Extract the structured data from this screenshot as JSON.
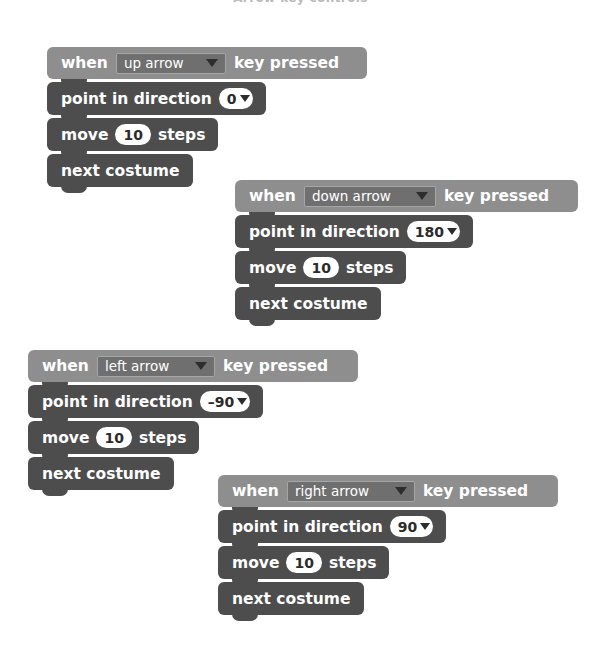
{
  "page": {
    "title": "Arrow key controls",
    "background": "#ffffff"
  },
  "palette": {
    "event_block": "#8e8e8e",
    "stack_block": "#4d4d4d",
    "dropdown_field": "#6f6f6f",
    "dropdown_border": "#a6a6a6",
    "input_oval": "#ffffff",
    "text": "#ffffff",
    "oval_text": "#2b2b2b"
  },
  "scripts": [
    {
      "id": "script-up-arrow",
      "position": {
        "left": 47,
        "top": 27
      },
      "hat": {
        "name": "when-key-pressed-block",
        "prefix": "when",
        "suffix": "key pressed",
        "dropdown": {
          "name": "key-dropdown",
          "value": "up arrow",
          "icon": "chevron-down-icon",
          "width": 110
        },
        "dome_width": 156,
        "body_width": 320
      },
      "blocks": [
        {
          "name": "point-in-direction-block",
          "label": "point in direction",
          "field": {
            "type": "oval-dropdown",
            "name": "direction-field",
            "value": "0",
            "icon": "chevron-down-icon"
          }
        },
        {
          "name": "move-steps-block",
          "label_before": "move",
          "label_after": "steps",
          "field": {
            "type": "oval",
            "name": "steps-field",
            "value": "10"
          }
        },
        {
          "name": "next-costume-block",
          "label": "next costume"
        }
      ]
    },
    {
      "id": "script-down-arrow",
      "position": {
        "left": 235,
        "top": 160
      },
      "hat": {
        "name": "when-key-pressed-block",
        "prefix": "when",
        "suffix": "key pressed",
        "dropdown": {
          "name": "key-dropdown",
          "value": "down arrow",
          "icon": "chevron-down-icon",
          "width": 132
        },
        "dome_width": 158,
        "body_width": 343
      },
      "blocks": [
        {
          "name": "point-in-direction-block",
          "label": "point in direction",
          "field": {
            "type": "oval-dropdown",
            "name": "direction-field",
            "value": "180",
            "icon": "chevron-down-icon"
          }
        },
        {
          "name": "move-steps-block",
          "label_before": "move",
          "label_after": "steps",
          "field": {
            "type": "oval",
            "name": "steps-field",
            "value": "10"
          }
        },
        {
          "name": "next-costume-block",
          "label": "next costume"
        }
      ]
    },
    {
      "id": "script-left-arrow",
      "position": {
        "left": 28,
        "top": 330
      },
      "hat": {
        "name": "when-key-pressed-block",
        "prefix": "when",
        "suffix": "key pressed",
        "dropdown": {
          "name": "key-dropdown",
          "value": "left arrow",
          "icon": "chevron-down-icon",
          "width": 118
        },
        "dome_width": 156,
        "body_width": 330
      },
      "blocks": [
        {
          "name": "point-in-direction-block",
          "label": "point in direction",
          "field": {
            "type": "oval-dropdown",
            "name": "direction-field",
            "value": "–90",
            "icon": "chevron-down-icon"
          }
        },
        {
          "name": "move-steps-block",
          "label_before": "move",
          "label_after": "steps",
          "field": {
            "type": "oval",
            "name": "steps-field",
            "value": "10"
          }
        },
        {
          "name": "next-costume-block",
          "label": "next costume"
        }
      ]
    },
    {
      "id": "script-right-arrow",
      "position": {
        "left": 218,
        "top": 455
      },
      "hat": {
        "name": "when-key-pressed-block",
        "prefix": "when",
        "suffix": "key pressed",
        "dropdown": {
          "name": "key-dropdown",
          "value": "right arrow",
          "icon": "chevron-down-icon",
          "width": 128
        },
        "dome_width": 157,
        "body_width": 340
      },
      "blocks": [
        {
          "name": "point-in-direction-block",
          "label": "point in direction",
          "field": {
            "type": "oval-dropdown",
            "name": "direction-field",
            "value": "90",
            "icon": "chevron-down-icon"
          }
        },
        {
          "name": "move-steps-block",
          "label_before": "move",
          "label_after": "steps",
          "field": {
            "type": "oval",
            "name": "steps-field",
            "value": "10"
          }
        },
        {
          "name": "next-costume-block",
          "label": "next costume"
        }
      ]
    }
  ]
}
